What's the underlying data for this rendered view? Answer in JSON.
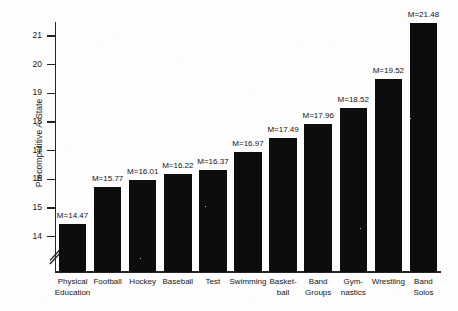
{
  "chart_data": {
    "type": "bar",
    "title": "",
    "xlabel": "",
    "ylabel": "Precompetitive A-State",
    "ylim": [
      13.6,
      21.7
    ],
    "yticks": [
      14,
      15,
      16,
      17,
      18,
      19,
      20,
      21
    ],
    "ytick_labels": [
      "14",
      "15",
      "16",
      "17",
      "18",
      "19",
      "20",
      "21"
    ],
    "axis_break": true,
    "axis_break_note": "double-slash break on y-axis below 14",
    "grid": false,
    "legend": null,
    "bar_color": "#0d0d0d",
    "value_label_prefix": "M=",
    "categories": [
      "Physical Education",
      "Football",
      "Hockey",
      "Baseball",
      "Test",
      "Swimming",
      "Basket-ball",
      "Band Groups",
      "Gym-nastics",
      "Wrestling",
      "Band Solos"
    ],
    "category_lines": [
      [
        "Physical",
        "Education"
      ],
      [
        "Football"
      ],
      [
        "Hockey"
      ],
      [
        "Baseball"
      ],
      [
        "Test"
      ],
      [
        "Swimming"
      ],
      [
        "Basket-",
        "ball"
      ],
      [
        "Band",
        "Groups"
      ],
      [
        "Gym-",
        "nastics"
      ],
      [
        "Wrestling"
      ],
      [
        "Band",
        "Solos"
      ]
    ],
    "values": [
      14.47,
      15.77,
      16.01,
      16.22,
      16.37,
      16.97,
      17.49,
      17.96,
      18.52,
      19.52,
      21.48
    ],
    "value_labels": [
      "M=14.47",
      "M=15.77",
      "M=16.01",
      "M=16.22",
      "M=16.37",
      "M=16.97",
      "M=17.49",
      "M=17.96",
      "M=18.52",
      "M=19.52",
      "M=21.48"
    ]
  }
}
